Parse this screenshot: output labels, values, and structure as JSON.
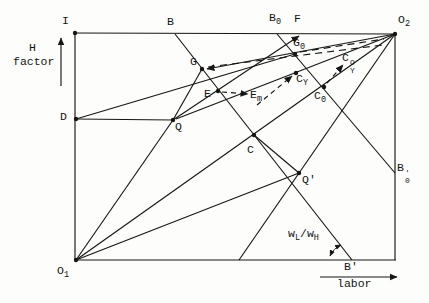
{
  "figure": {
    "kind": "edgeworth-box-diagram",
    "width": 429,
    "height": 303,
    "ink_color": "#161616",
    "background_color": "#fdfdfb"
  },
  "axes": {
    "vertical_axis_label_line1": "H",
    "vertical_axis_label_line2": "factor",
    "horizontal_axis_label": "labor"
  },
  "labels": [
    {
      "id": "I",
      "x": 62,
      "y": 15,
      "parts": [
        {
          "t": "I"
        }
      ]
    },
    {
      "id": "H",
      "x": 29,
      "y": 42,
      "parts": [
        {
          "t": "H"
        }
      ]
    },
    {
      "id": "factor",
      "x": 13,
      "y": 56,
      "parts": [
        {
          "t": "factor"
        }
      ]
    },
    {
      "id": "B",
      "x": 167,
      "y": 16,
      "parts": [
        {
          "t": "B"
        }
      ]
    },
    {
      "id": "B0",
      "x": 269,
      "y": 12,
      "parts": [
        {
          "t": "B"
        },
        {
          "t": "0",
          "sub": 1
        }
      ]
    },
    {
      "id": "F",
      "x": 294,
      "y": 13,
      "parts": [
        {
          "t": "F"
        }
      ]
    },
    {
      "id": "O2",
      "x": 398,
      "y": 14,
      "parts": [
        {
          "t": "O"
        },
        {
          "t": "2",
          "sub": 1
        }
      ]
    },
    {
      "id": "G",
      "x": 190,
      "y": 56,
      "parts": [
        {
          "t": "G"
        }
      ]
    },
    {
      "id": "G0",
      "x": 293,
      "y": 37,
      "parts": [
        {
          "t": "G"
        },
        {
          "t": "0",
          "sub": 1
        }
      ]
    },
    {
      "id": "E",
      "x": 204,
      "y": 88,
      "parts": [
        {
          "t": "E"
        }
      ]
    },
    {
      "id": "Em",
      "x": 250,
      "y": 89,
      "parts": [
        {
          "t": "E"
        },
        {
          "t": "m",
          "sub": 1
        }
      ]
    },
    {
      "id": "CY",
      "x": 296,
      "y": 73,
      "parts": [
        {
          "t": "C"
        },
        {
          "t": "Y",
          "sub": 1
        }
      ]
    },
    {
      "id": "C0",
      "x": 314,
      "y": 90,
      "parts": [
        {
          "t": "C"
        },
        {
          "t": "0",
          "sub": 1
        }
      ]
    },
    {
      "id": "CY0",
      "x": 342,
      "y": 52,
      "parts": [
        {
          "t": "C"
        },
        {
          "stack": [
            "O",
            "Y"
          ]
        }
      ]
    },
    {
      "id": "C",
      "x": 247,
      "y": 144,
      "parts": [
        {
          "t": "C"
        }
      ]
    },
    {
      "id": "D",
      "x": 60,
      "y": 111,
      "parts": [
        {
          "t": "D"
        }
      ]
    },
    {
      "id": "Q",
      "x": 175,
      "y": 121,
      "parts": [
        {
          "t": "Q"
        }
      ]
    },
    {
      "id": "Qprime",
      "x": 302,
      "y": 174,
      "parts": [
        {
          "t": "Q'"
        }
      ]
    },
    {
      "id": "B0prime",
      "x": 397,
      "y": 162,
      "parts": [
        {
          "t": "B"
        },
        {
          "stack": [
            "'",
            "0"
          ]
        }
      ]
    },
    {
      "id": "Bprime",
      "x": 344,
      "y": 261,
      "parts": [
        {
          "t": "B'"
        }
      ]
    },
    {
      "id": "O1",
      "x": 57,
      "y": 265,
      "parts": [
        {
          "t": "O"
        },
        {
          "t": "1",
          "sub": 1
        }
      ]
    },
    {
      "id": "wLwH",
      "x": 288,
      "y": 228,
      "parts": [
        {
          "t": "w"
        },
        {
          "t": "L",
          "sub": 1
        },
        {
          "t": "/"
        },
        {
          "t": "w"
        },
        {
          "t": "H",
          "sub": 1
        }
      ]
    },
    {
      "id": "labor",
      "x": 337,
      "y": 278,
      "parts": [
        {
          "t": "labor"
        }
      ]
    }
  ],
  "lines": [
    {
      "id": "box-top",
      "x1": 75,
      "y1": 33,
      "x2": 395,
      "y2": 34
    },
    {
      "id": "box-left",
      "x1": 75,
      "y1": 33,
      "x2": 75,
      "y2": 260
    },
    {
      "id": "box-bottom",
      "x1": 75,
      "y1": 260,
      "x2": 396,
      "y2": 260
    },
    {
      "id": "box-right",
      "x1": 395,
      "y1": 34,
      "x2": 395,
      "y2": 260
    },
    {
      "id": "diagonal-O1-O2",
      "x1": 76,
      "y1": 260,
      "x2": 395,
      "y2": 34
    },
    {
      "id": "line-B-Bprime",
      "x1": 175,
      "y1": 34,
      "x2": 352,
      "y2": 260
    },
    {
      "id": "line-B0-B0prime",
      "x1": 277,
      "y1": 34,
      "x2": 395,
      "y2": 173
    },
    {
      "id": "ray-O1-Q",
      "x1": 76,
      "y1": 260,
      "x2": 173,
      "y2": 120
    },
    {
      "id": "seg-Q-G",
      "x1": 173,
      "y1": 120,
      "x2": 202,
      "y2": 69
    },
    {
      "id": "seg-D-Q",
      "x1": 76,
      "y1": 119,
      "x2": 173,
      "y2": 120
    },
    {
      "id": "seg-D-G0",
      "x1": 76,
      "y1": 119,
      "x2": 295,
      "y2": 54
    },
    {
      "id": "line-Q-E-F",
      "x1": 173,
      "y1": 120,
      "x2": 299,
      "y2": 36,
      "arrow": "end"
    },
    {
      "id": "line-O2-G",
      "x1": 395,
      "y1": 34,
      "x2": 207,
      "y2": 69,
      "arrow": "end"
    },
    {
      "id": "line-O2-Q",
      "x1": 395,
      "y1": 34,
      "x2": 176,
      "y2": 119
    },
    {
      "id": "line-O2-Qprime",
      "x1": 395,
      "y1": 34,
      "x2": 239,
      "y2": 260
    },
    {
      "id": "ray-O1-Qprime",
      "x1": 76,
      "y1": 260,
      "x2": 299,
      "y2": 173
    },
    {
      "id": "seg-C-Qprime",
      "x1": 254,
      "y1": 135,
      "x2": 299,
      "y2": 173
    },
    {
      "id": "axis-H-arrow",
      "x1": 61,
      "y1": 86,
      "x2": 61,
      "y2": 38,
      "arrow": "end"
    },
    {
      "id": "axis-labor-arrow",
      "x1": 320,
      "y1": 277,
      "x2": 397,
      "y2": 277,
      "arrow": "end"
    },
    {
      "id": "dash-G-toward-O2",
      "x1": 208,
      "y1": 67,
      "x2": 383,
      "y2": 45,
      "dash": "7 5"
    },
    {
      "id": "dash-G0-toward-O2",
      "x1": 300,
      "y1": 52,
      "x2": 384,
      "y2": 39,
      "dash": "7 5"
    },
    {
      "id": "dash-E-Em",
      "x1": 222,
      "y1": 92,
      "x2": 248,
      "y2": 94,
      "dash": "5 4",
      "arrow": "end"
    },
    {
      "id": "dash-Em-CY",
      "x1": 257,
      "y1": 105,
      "x2": 292,
      "y2": 76,
      "dash": "5 4",
      "arrow": "end"
    },
    {
      "id": "dash-C0-CY0",
      "x1": 327,
      "y1": 83,
      "x2": 343,
      "y2": 65,
      "dash": "5 4",
      "arrow": "end"
    }
  ],
  "arcs": [
    {
      "id": "angle-arc-wage-ratio",
      "d": "M 330 256 A 22 22 0 0 1 341 245",
      "arrow": "both"
    }
  ],
  "points": [
    {
      "id": "corner-top-left",
      "x": 75,
      "y": 33
    },
    {
      "id": "corner-O2",
      "x": 395,
      "y": 34
    },
    {
      "id": "corner-O1",
      "x": 76,
      "y": 260
    },
    {
      "id": "point-D",
      "x": 76,
      "y": 119
    },
    {
      "id": "point-Q",
      "x": 173,
      "y": 120
    },
    {
      "id": "point-G",
      "x": 202,
      "y": 69
    },
    {
      "id": "point-E",
      "x": 218,
      "y": 91
    },
    {
      "id": "point-C",
      "x": 254,
      "y": 135
    },
    {
      "id": "point-Qprime",
      "x": 299,
      "y": 173
    },
    {
      "id": "point-G0",
      "x": 295,
      "y": 54
    },
    {
      "id": "point-CY",
      "x": 296,
      "y": 73
    },
    {
      "id": "point-C0",
      "x": 324,
      "y": 87
    }
  ]
}
